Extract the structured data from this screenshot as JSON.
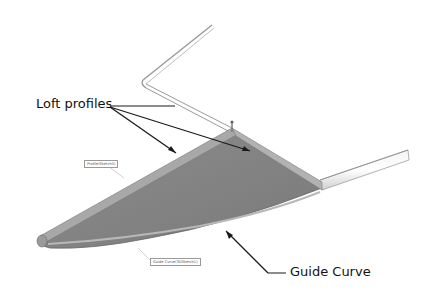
{
  "diagram": {
    "colors": {
      "surface": "#8a8a8a",
      "surface_dark": "#6f6f6f",
      "edge_highlight": "#c8c8c8",
      "wire": "#9a9a9a",
      "leader": "#1a1a1a"
    },
    "callouts": {
      "loft_profiles": "Loft profiles",
      "guide_curve": "Guide Curve"
    },
    "tags": {
      "profile": "Profile(Sketch5)",
      "guide_curve": "Guide Curve(3DSketch1)"
    }
  }
}
